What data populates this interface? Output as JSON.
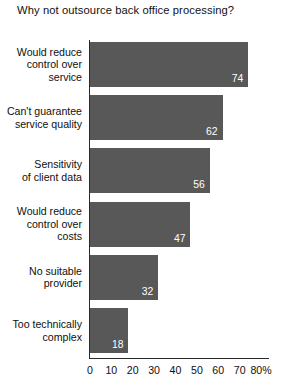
{
  "chart_data": {
    "type": "bar",
    "orientation": "horizontal",
    "title": "Why not outsource back office processing?",
    "xlabel": "",
    "ylabel": "",
    "categories": [
      "Would reduce control over service",
      "Can't guarantee service quality",
      "Sensitivity of client data",
      "Would reduce control over costs",
      "No suitable provider",
      "Too technically complex"
    ],
    "category_lines": [
      [
        "Would reduce",
        "control over",
        "service"
      ],
      [
        "Can't guarantee",
        "service quality"
      ],
      [
        "Sensitivity",
        "of client data"
      ],
      [
        "Would reduce",
        "control over",
        "costs"
      ],
      [
        "No suitable",
        "provider"
      ],
      [
        "Too technically",
        "complex"
      ]
    ],
    "values": [
      74,
      62,
      56,
      47,
      32,
      18
    ],
    "value_labels": [
      "74",
      "62",
      "56",
      "47",
      "32",
      "18"
    ],
    "xlim": [
      0,
      80
    ],
    "xticks": [
      0,
      10,
      20,
      30,
      40,
      50,
      60,
      70,
      80
    ],
    "xtick_labels": [
      "0",
      "10",
      "20",
      "30",
      "40",
      "50",
      "60",
      "70",
      "80%"
    ],
    "grid": false,
    "legend": null,
    "bar_color": "#575857",
    "value_label_color": "#ffffff",
    "axis_color": "#2a2a2a",
    "background": "#ffffff"
  }
}
